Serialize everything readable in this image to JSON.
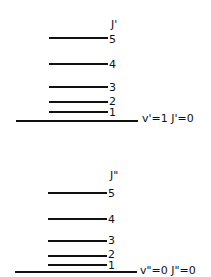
{
  "upper": {
    "header": "J'",
    "levels": [
      "5",
      "4",
      "3",
      "2",
      "1"
    ],
    "state_label": "v'=1  J'=0"
  },
  "lower": {
    "header": "J\"",
    "levels": [
      "5",
      "4",
      "3",
      "2",
      "1"
    ],
    "state_label": "v\"=0  J\"=0"
  }
}
